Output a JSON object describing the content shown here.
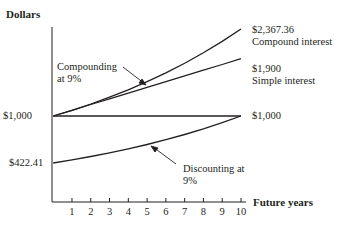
{
  "chart_data": {
    "type": "line",
    "title": "",
    "xlabel": "Future years",
    "ylabel": "Dollars",
    "x": [
      0,
      1,
      2,
      3,
      4,
      5,
      6,
      7,
      8,
      9,
      10
    ],
    "xticks": [
      "1",
      "2",
      "3",
      "4",
      "5",
      "6",
      "7",
      "8",
      "9",
      "10"
    ],
    "series": [
      {
        "name": "Compound interest",
        "values": [
          1000,
          1090,
          1188.1,
          1295.03,
          1411.58,
          1538.62,
          1677.1,
          1828.04,
          1992.56,
          2171.89,
          2367.36
        ],
        "end_label": "$2,367.36",
        "end_caption": "Compound interest"
      },
      {
        "name": "Simple interest",
        "values": [
          1000,
          1090,
          1180,
          1270,
          1360,
          1450,
          1540,
          1630,
          1720,
          1810,
          1900
        ],
        "end_label": "$1,900",
        "end_caption": "Simple interest"
      },
      {
        "name": "Present value",
        "values": [
          1000,
          1000,
          1000,
          1000,
          1000,
          1000,
          1000,
          1000,
          1000,
          1000,
          1000
        ],
        "end_label": "$1,000"
      },
      {
        "name": "Discounting at 9%",
        "values": [
          422.41,
          460.43,
          501.87,
          547.03,
          596.27,
          649.93,
          708.43,
          772.18,
          841.68,
          917.43,
          1000
        ],
        "start_label": "$422.41"
      }
    ],
    "annotations": [
      {
        "text": "Compounding at 9%",
        "points_to": "Compound interest"
      },
      {
        "text": "Discounting at 9%",
        "points_to": "Discounting at 9%"
      }
    ],
    "ytick_labels": [
      "$1,000",
      "$422.41"
    ],
    "grid": false,
    "legend": "none"
  },
  "labels": {
    "y_axis_title": "Dollars",
    "x_axis_title": "Future years",
    "y_1000": "$1,000",
    "y_422": "$422.41",
    "compound_value": "$2,367.36",
    "compound_caption": "Compound interest",
    "simple_value": "$1,900",
    "simple_caption": "Simple interest",
    "flat_value": "$1,000",
    "compounding_line1": "Compounding",
    "compounding_line2": "at 9%",
    "discounting_line1": "Discounting at",
    "discounting_line2": "9%"
  }
}
